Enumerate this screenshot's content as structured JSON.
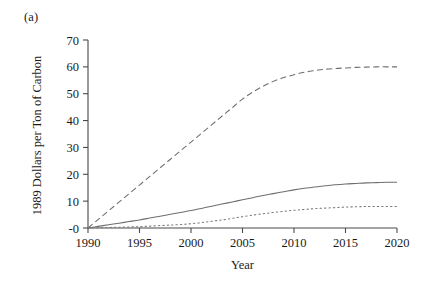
{
  "figure": {
    "panel_label": "(a)",
    "background_color": "#ffffff",
    "axis_color": "#4a4a4a"
  },
  "chart_data": {
    "type": "line",
    "title": "",
    "subtitle": "",
    "xlabel": "Year",
    "ylabel": "1989 Dollars per Ton of Carbon",
    "xlim": [
      1990,
      2020
    ],
    "ylim": [
      0,
      70
    ],
    "xticks": [
      1990,
      1995,
      2000,
      2005,
      2010,
      2015,
      2020
    ],
    "xticklabels": [
      "1990",
      "1995",
      "2000",
      "2005",
      "2010",
      "2015",
      "2020"
    ],
    "yticks": [
      0,
      10,
      20,
      30,
      40,
      50,
      60,
      70
    ],
    "yticklabels": [
      "-0",
      "10",
      "20",
      "30",
      "40",
      "50",
      "60",
      "70"
    ],
    "grid": false,
    "legend": "none",
    "x": [
      1990,
      1991,
      1992,
      1993,
      1994,
      1995,
      1996,
      1997,
      1998,
      1999,
      2000,
      2001,
      2002,
      2003,
      2004,
      2005,
      2006,
      2007,
      2008,
      2009,
      2010,
      2011,
      2012,
      2013,
      2014,
      2015,
      2016,
      2017,
      2018,
      2019,
      2020
    ],
    "series": [
      {
        "name": "dashed-series",
        "style": "dashed",
        "color": "#6e6e6e",
        "values": [
          0,
          3.2,
          6.4,
          9.6,
          12.8,
          16.0,
          19.2,
          22.4,
          25.6,
          28.8,
          32.0,
          35.2,
          38.4,
          41.6,
          44.8,
          48.0,
          50.6,
          52.8,
          54.6,
          56.0,
          57.1,
          58.0,
          58.6,
          59.1,
          59.4,
          59.6,
          59.8,
          59.9,
          60.0,
          60.0,
          60.0
        ]
      },
      {
        "name": "solid-series",
        "style": "solid",
        "color": "#6e6e6e",
        "values": [
          0,
          0.6,
          1.2,
          1.8,
          2.4,
          3.0,
          3.7,
          4.4,
          5.1,
          5.8,
          6.5,
          7.3,
          8.1,
          8.9,
          9.7,
          10.5,
          11.3,
          12.1,
          12.8,
          13.5,
          14.2,
          14.8,
          15.3,
          15.7,
          16.1,
          16.4,
          16.6,
          16.8,
          16.9,
          17.0,
          17.0
        ]
      },
      {
        "name": "dotted-series",
        "style": "dotted",
        "color": "#7a7a7a",
        "values": [
          0,
          0.1,
          0.2,
          0.3,
          0.4,
          0.5,
          0.7,
          0.9,
          1.1,
          1.3,
          1.6,
          2.0,
          2.5,
          3.0,
          3.6,
          4.2,
          4.8,
          5.3,
          5.8,
          6.2,
          6.6,
          6.9,
          7.2,
          7.4,
          7.6,
          7.8,
          7.9,
          8.0,
          8.0,
          8.0,
          8.0
        ]
      }
    ]
  }
}
